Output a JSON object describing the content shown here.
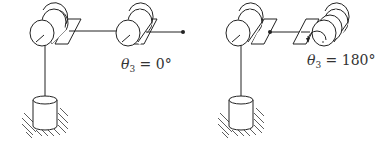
{
  "figure": {
    "configurations": [
      {
        "id": "config-left",
        "label_var": "θ",
        "label_sub": "3",
        "label_rest": " = 0°",
        "theta3_deg": 0
      },
      {
        "id": "config-right",
        "label_var": "θ",
        "label_sub": "3",
        "label_rest": " = 180°",
        "theta3_deg": 180
      }
    ],
    "colors": {
      "line": "#222222",
      "text": "#333333",
      "background": "#ffffff"
    }
  }
}
